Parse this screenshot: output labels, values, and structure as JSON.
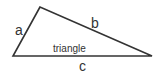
{
  "diagram": {
    "shape": "triangle",
    "name_label": "triangle",
    "sides": [
      {
        "id": "a",
        "label": "a"
      },
      {
        "id": "b",
        "label": "b"
      },
      {
        "id": "c",
        "label": "c"
      }
    ],
    "stroke_color": "#333333",
    "background": "#ffffff"
  }
}
